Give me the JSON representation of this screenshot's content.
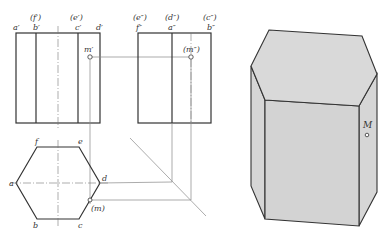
{
  "front_view": {
    "labels_top": [
      "(f′)",
      "(e′)"
    ],
    "labels_corner": [
      "a′",
      "b′",
      "c′",
      "d′"
    ],
    "point_label": "m′"
  },
  "side_view": {
    "labels_top": [
      "(e″)",
      "(d″)",
      "(c″)"
    ],
    "labels_corner": [
      "f″",
      "a″",
      "b″"
    ],
    "point_label": "(m″)"
  },
  "top_view": {
    "vertex_labels": {
      "a": "a",
      "b": "b",
      "c": "c",
      "d": "d",
      "e": "e",
      "f": "f"
    },
    "point_label": "(m)"
  },
  "isometric": {
    "point_label": "M"
  }
}
